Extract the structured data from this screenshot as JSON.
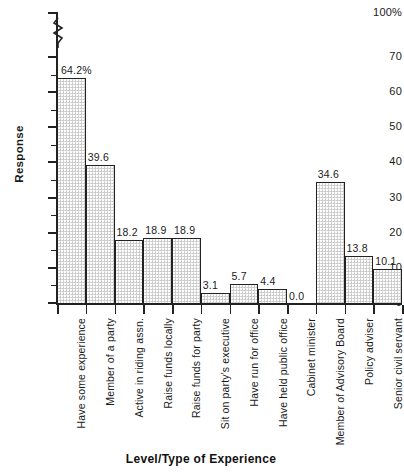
{
  "chart_data": {
    "type": "bar",
    "title": "",
    "xlabel": "Level/Type of Experience",
    "ylabel": "Response",
    "ylim": [
      0,
      70
    ],
    "y_axis_top_label": "100%",
    "has_axis_break": true,
    "axis_break_between": [
      70,
      100
    ],
    "grid": false,
    "legend": null,
    "y_ticks_major": [
      0,
      10,
      20,
      30,
      40,
      50,
      60,
      70
    ],
    "y_tick_labels": [
      "0",
      "10",
      "20",
      "30",
      "40",
      "50",
      "60",
      "70",
      "100%"
    ],
    "y_ticks_minor": [
      5,
      15,
      25,
      35,
      45,
      55,
      65
    ],
    "categories": [
      "Have some experience",
      "Member of a party",
      "Active in riding assn.",
      "Raise funds locally",
      "Raise funds for party",
      "Sit on party's executive",
      "Have run for office",
      "Have held public office",
      "Cabinet minister",
      "Member of Advisory Board",
      "Policy adviser",
      "Senior civil servant"
    ],
    "values": [
      64.2,
      39.6,
      18.2,
      18.9,
      18.9,
      3.1,
      5.7,
      4.4,
      0.0,
      34.6,
      13.8,
      10.1
    ],
    "value_labels": [
      "64.2%",
      "39.6",
      "18.2",
      "18.9",
      "18.9",
      "3.1",
      "5.7",
      "4.4",
      "0.0",
      "34.6",
      "13.8",
      "10.1"
    ],
    "bar_fill_color": "#dcdcdc",
    "bar_edge_color": "#222222",
    "axis_color": "#222222",
    "background_color": "#ffffff"
  }
}
